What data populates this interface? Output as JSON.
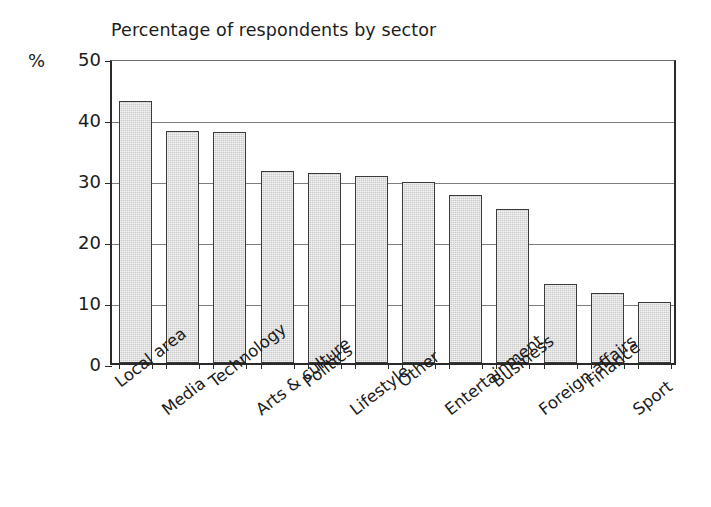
{
  "chart_data": {
    "type": "bar",
    "title": "Percentage of respondents by sector",
    "xlabel": "",
    "ylabel": "%",
    "unit_label": "%",
    "categories": [
      "Local area",
      "Media",
      "Technology",
      "Arts & culture",
      "Politics",
      "Lifestyle",
      "Other",
      "Entertainment",
      "Business",
      "Foreign affairs",
      "Finance",
      "Sport"
    ],
    "values": [
      43.0,
      38.1,
      37.8,
      31.5,
      31.2,
      30.6,
      29.6,
      27.5,
      25.2,
      13.0,
      11.5,
      10.0
    ],
    "ylim": [
      0,
      50
    ],
    "yticks": [
      0,
      10,
      20,
      30,
      40,
      50
    ],
    "ytick_labels": [
      "0",
      "10",
      "20",
      "30",
      "40",
      "50"
    ],
    "grid": true,
    "grid_axis": "y",
    "legend": "none",
    "bar_fill_color": "#c9c9c9",
    "bar_edge_color": "#3a3a3a",
    "background_color": "#ffffff",
    "axis_color": "#2a2a2a",
    "gridline_color": "#7d7d7d"
  }
}
